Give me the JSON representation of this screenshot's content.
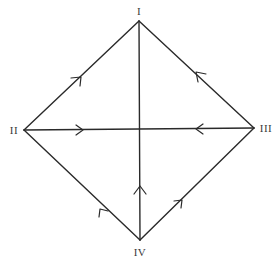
{
  "diagram": {
    "type": "directed-graph",
    "shape": "diamond with cross",
    "colors": {
      "stroke": "#2a2a2a",
      "label": "#3a3a3a",
      "background": "#ffffff"
    },
    "vertices": [
      {
        "id": "I",
        "label": "I",
        "x": 139,
        "y": 21
      },
      {
        "id": "II",
        "label": "II",
        "x": 24,
        "y": 130
      },
      {
        "id": "III",
        "label": "III",
        "x": 254,
        "y": 128
      },
      {
        "id": "IV",
        "label": "IV",
        "x": 140,
        "y": 240
      },
      {
        "id": "C",
        "label": "",
        "x": 140,
        "y": 129
      }
    ],
    "edges": [
      {
        "from": "II",
        "to": "I",
        "arrow": "toward I"
      },
      {
        "from": "III",
        "to": "I",
        "arrow": "toward I"
      },
      {
        "from": "II",
        "to": "C",
        "arrow": "toward center (right)"
      },
      {
        "from": "III",
        "to": "C",
        "arrow": "toward center (left)"
      },
      {
        "from": "IV",
        "to": "C",
        "arrow": "toward center (up)"
      },
      {
        "from": "IV",
        "to": "II",
        "arrow": "toward II"
      },
      {
        "from": "IV",
        "to": "III",
        "arrow": "toward III"
      },
      {
        "from": "C",
        "to": "I",
        "arrow": "none"
      }
    ]
  }
}
